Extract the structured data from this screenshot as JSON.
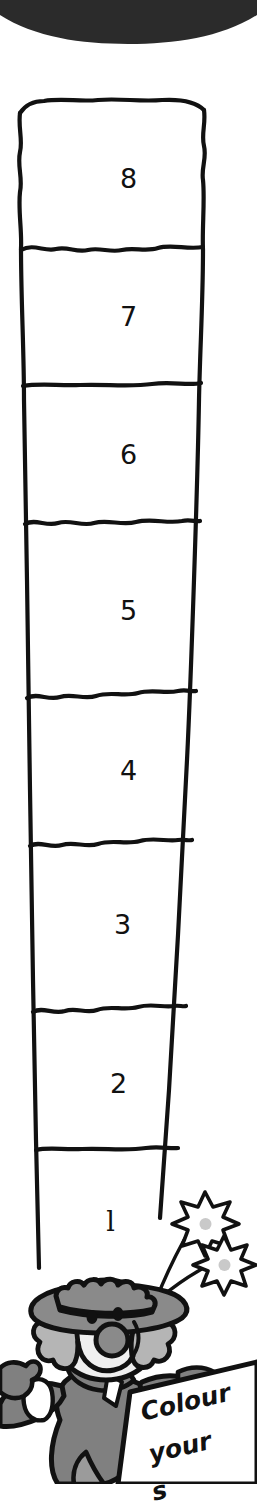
{
  "page": {
    "background_color": "#ffffff",
    "ink_color": "#111111",
    "shade_gray": "#808080",
    "light_gray": "#d4d4d4",
    "top_arc_color": "#2b2b2b"
  },
  "tower": {
    "name": "numbered-tower",
    "segment_count": 8,
    "segments": [
      {
        "label": "8",
        "index": 8
      },
      {
        "label": "7",
        "index": 7
      },
      {
        "label": "6",
        "index": 6
      },
      {
        "label": "5",
        "index": 5
      },
      {
        "label": "4",
        "index": 4
      },
      {
        "label": "3",
        "index": 3
      },
      {
        "label": "2",
        "index": 2
      },
      {
        "label": "l",
        "index": 1
      }
    ]
  },
  "character": {
    "name": "clown",
    "hat": "gray-brimmed-hat",
    "hair": "curly-gray-hair",
    "nose": "round-gray-nose",
    "expression": "smiling"
  },
  "decorations": {
    "flowers": [
      {
        "name": "flower-upper",
        "petals": 7
      },
      {
        "name": "flower-lower",
        "petals": 7
      }
    ]
  },
  "sign": {
    "line1": "Colour",
    "line2": "your",
    "line3": "s"
  }
}
